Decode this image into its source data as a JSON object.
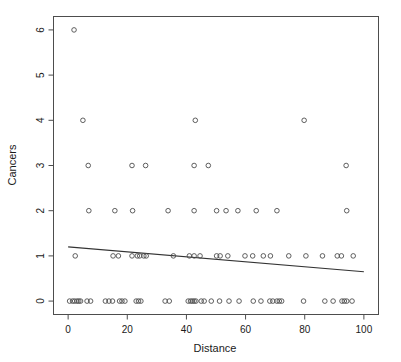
{
  "chart_data": {
    "type": "scatter",
    "title": "",
    "xlabel": "Distance",
    "ylabel": "Cancers",
    "xlim": [
      0,
      100
    ],
    "ylim": [
      0,
      6
    ],
    "grid": false,
    "legend": null,
    "marker": "open-circle",
    "x_ticks": [
      0,
      20,
      40,
      60,
      80,
      100
    ],
    "y_ticks": [
      0,
      1,
      2,
      3,
      4,
      5,
      6
    ],
    "x_tick_labels": [
      "0",
      "20",
      "40",
      "60",
      "80",
      "100"
    ],
    "y_tick_labels": [
      "0",
      "1",
      "2",
      "3",
      "4",
      "5",
      "6"
    ],
    "series": [
      {
        "name": "observations",
        "points": [
          [
            0.5,
            0
          ],
          [
            1.5,
            0
          ],
          [
            2.2,
            0
          ],
          [
            3.0,
            0
          ],
          [
            3.6,
            0
          ],
          [
            4.2,
            0
          ],
          [
            6.4,
            0
          ],
          [
            7.6,
            0
          ],
          [
            12.6,
            0
          ],
          [
            13.8,
            0
          ],
          [
            15.0,
            0
          ],
          [
            17.4,
            0
          ],
          [
            18.2,
            0
          ],
          [
            19.2,
            0
          ],
          [
            23.0,
            0
          ],
          [
            23.8,
            0
          ],
          [
            24.6,
            0
          ],
          [
            32.8,
            0
          ],
          [
            34.2,
            0
          ],
          [
            40.6,
            0
          ],
          [
            41.4,
            0
          ],
          [
            42.0,
            0
          ],
          [
            42.6,
            0
          ],
          [
            43.2,
            0
          ],
          [
            45.0,
            0
          ],
          [
            46.0,
            0
          ],
          [
            48.4,
            0
          ],
          [
            51.2,
            0
          ],
          [
            54.4,
            0
          ],
          [
            57.8,
            0
          ],
          [
            62.6,
            0
          ],
          [
            65.2,
            0
          ],
          [
            68.2,
            0
          ],
          [
            69.2,
            0
          ],
          [
            70.6,
            0
          ],
          [
            71.4,
            0
          ],
          [
            72.2,
            0
          ],
          [
            79.6,
            0
          ],
          [
            86.8,
            0
          ],
          [
            89.6,
            0
          ],
          [
            92.6,
            0
          ],
          [
            93.4,
            0
          ],
          [
            94.2,
            0
          ],
          [
            96.0,
            0
          ],
          [
            2.4,
            1
          ],
          [
            15.2,
            1
          ],
          [
            17.0,
            1
          ],
          [
            21.6,
            1
          ],
          [
            23.4,
            1
          ],
          [
            24.2,
            1
          ],
          [
            25.6,
            1
          ],
          [
            26.4,
            1
          ],
          [
            35.6,
            1
          ],
          [
            41.0,
            1
          ],
          [
            42.6,
            1
          ],
          [
            44.6,
            1
          ],
          [
            50.2,
            1
          ],
          [
            51.4,
            1
          ],
          [
            54.0,
            1
          ],
          [
            59.8,
            1
          ],
          [
            62.4,
            1
          ],
          [
            66.0,
            1
          ],
          [
            68.4,
            1
          ],
          [
            74.6,
            1
          ],
          [
            80.4,
            1
          ],
          [
            86.0,
            1
          ],
          [
            91.0,
            1
          ],
          [
            92.4,
            1
          ],
          [
            96.4,
            1
          ],
          [
            7.0,
            2
          ],
          [
            15.8,
            2
          ],
          [
            21.8,
            2
          ],
          [
            33.8,
            2
          ],
          [
            42.6,
            2
          ],
          [
            50.2,
            2
          ],
          [
            53.4,
            2
          ],
          [
            57.4,
            2
          ],
          [
            63.6,
            2
          ],
          [
            70.6,
            2
          ],
          [
            94.2,
            2
          ],
          [
            6.8,
            3
          ],
          [
            21.6,
            3
          ],
          [
            26.2,
            3
          ],
          [
            42.6,
            3
          ],
          [
            47.4,
            3
          ],
          [
            94.0,
            3
          ],
          [
            5.0,
            4
          ],
          [
            43.0,
            4
          ],
          [
            79.8,
            4
          ],
          [
            2.0,
            6
          ]
        ]
      }
    ],
    "fit_line": {
      "name": "linear-regression",
      "x_start": 0,
      "y_start": 1.2,
      "x_end": 100,
      "y_end": 0.65
    }
  },
  "style": {
    "point_stroke": "#4d4d4d",
    "axis_color": "#4d4d4d",
    "line_color": "#333333",
    "text_color": "#1a1a1a",
    "background": "#ffffff"
  }
}
